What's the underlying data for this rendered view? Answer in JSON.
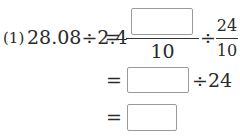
{
  "problem": {
    "label": "(1)",
    "expression": "28.08÷2.4",
    "equals": "=",
    "line1": {
      "fraction1": {
        "numerator_box": "",
        "denominator": "10"
      },
      "operator": "÷",
      "fraction2": {
        "numerator": "24",
        "denominator": "10"
      }
    },
    "line2": {
      "equals": "=",
      "answer_box": "",
      "operator_text": "÷24"
    },
    "line3": {
      "equals": "=",
      "answer_box": ""
    }
  }
}
